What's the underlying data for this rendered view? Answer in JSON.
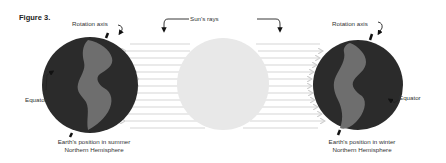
{
  "figure": {
    "title": "Figure 3.",
    "labels": {
      "suns_rays": "Sun's rays",
      "rotation_axis_left": "Rotation axis",
      "rotation_axis_right": "Rotation axis",
      "equator_left": "Equator",
      "equator_right": "Equator"
    },
    "captions": {
      "summer_line1": "Earth's position in summer",
      "summer_line2": "Northern Hemisphere",
      "winter_line1": "Earth's position in winter",
      "winter_line2": "Northern Hemisphere"
    },
    "colors": {
      "sun": "#e8e8e8",
      "rays": "#d6d6d6",
      "earth_ocean": "#2b2b2b",
      "earth_land": "#6e6e6e",
      "text": "#333333"
    }
  }
}
